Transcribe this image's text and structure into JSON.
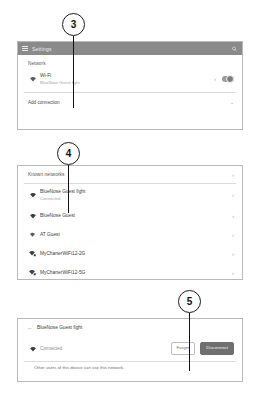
{
  "settings_window": {
    "titlebar": {
      "menu_icon": "hamburger-menu-icon",
      "title": "Settings",
      "search_icon": "search-icon"
    },
    "section_label": "Network",
    "wifi_row": {
      "icon": "wifi-icon",
      "title": "Wi-Fi",
      "subtitle": "BlueNose Guest fight",
      "chevron": "›",
      "toggle_state": "on"
    },
    "add_connection": {
      "label": "Add connection",
      "chevron": "⌄"
    }
  },
  "known_networks": {
    "header": {
      "label": "Known networks",
      "chevron": "›"
    },
    "rows": [
      {
        "icon": "wifi-icon",
        "name": "BlueNose Guest fight",
        "status": "Connected",
        "chevron": "›",
        "secured": false
      },
      {
        "icon": "wifi-icon",
        "name": "BlueNose Guest",
        "status": "",
        "chevron": "›",
        "secured": false
      },
      {
        "icon": "wifi-icon",
        "name": "AT Guest",
        "status": "",
        "chevron": "›",
        "secured": false
      },
      {
        "icon": "wifi-lock-icon",
        "name": "MyCharterWiFi12-2G",
        "status": "",
        "chevron": "›",
        "secured": true
      },
      {
        "icon": "wifi-lock-icon",
        "name": "MyCharterWiFi12-5G",
        "status": "",
        "chevron": "›",
        "secured": true
      }
    ]
  },
  "network_detail": {
    "back_icon": "back-arrow-icon",
    "title": "BlueNose Guest fight",
    "wifi_icon": "wifi-icon",
    "status": "Connected",
    "buttons": {
      "forget": "Forget",
      "disconnect": "Disconnect"
    },
    "footer_note": "Other users of this device can use this network."
  },
  "callouts": [
    {
      "number": "3"
    },
    {
      "number": "4"
    },
    {
      "number": "5"
    }
  ],
  "colors": {
    "titlebar": "#8a8a8a",
    "card_border": "#b9b9b9",
    "primary_button": "#6f6f6f",
    "text": "#3b3b3b",
    "muted_text": "#a2a2a2"
  }
}
